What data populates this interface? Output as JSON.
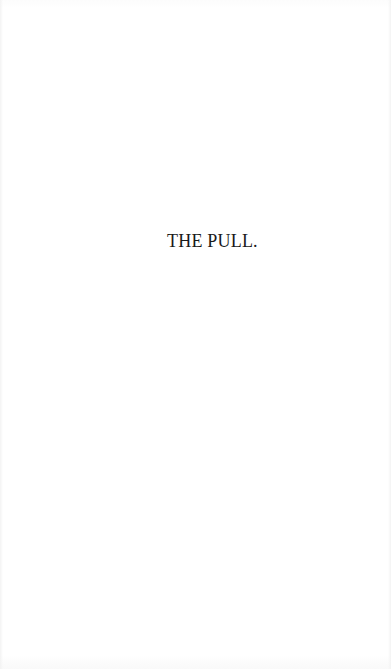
{
  "page": {
    "chapter_title": "THE PULL."
  },
  "colors": {
    "background": "#ffffff",
    "text": "#1a1a1a"
  }
}
